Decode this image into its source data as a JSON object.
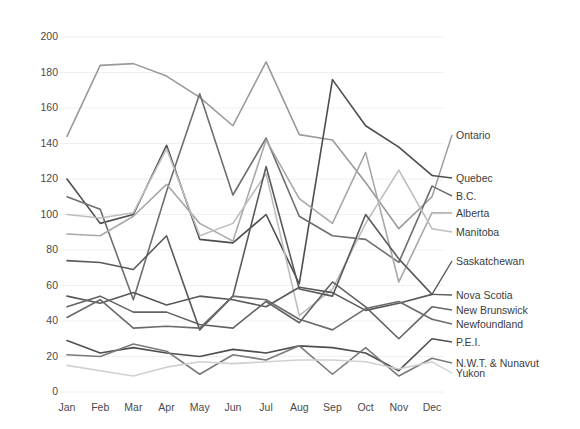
{
  "chart_data": {
    "type": "line",
    "title": "",
    "xlabel": "",
    "ylabel": "",
    "ylim": [
      0,
      200
    ],
    "ytick_step": 20,
    "grid": true,
    "legend_position": "right-inline-at-last-point",
    "categories": [
      "Jan",
      "Feb",
      "Mar",
      "Apr",
      "May",
      "Jun",
      "Jul",
      "Aug",
      "Sep",
      "Oct",
      "Nov",
      "Dec"
    ],
    "yticks": [
      0,
      20,
      40,
      60,
      80,
      100,
      120,
      140,
      160,
      180,
      200
    ],
    "series": [
      {
        "name": "Ontario",
        "color": "#9a9a9a",
        "values": [
          144,
          184,
          185,
          178,
          166,
          150,
          186,
          145,
          142,
          118,
          92,
          110
        ]
      },
      {
        "name": "Quebec",
        "color": "#4d4d4d",
        "values": [
          120,
          95,
          100,
          139,
          86,
          84,
          100,
          61,
          176,
          150,
          138,
          122
        ]
      },
      {
        "name": "B.C.",
        "color": "#6e6e6e",
        "values": [
          110,
          103,
          52,
          113,
          168,
          111,
          143,
          99,
          88,
          86,
          73,
          116
        ]
      },
      {
        "name": "Alberta",
        "color": "#a8a8a8",
        "values": [
          89,
          88,
          99,
          117,
          95,
          85,
          142,
          109,
          95,
          135,
          62,
          101
        ]
      },
      {
        "name": "Manitoba",
        "color": "#bdbdbd",
        "values": [
          100,
          98,
          101,
          137,
          88,
          95,
          123,
          43,
          58,
          95,
          125,
          92
        ]
      },
      {
        "name": "Saskatchewan",
        "color": "#5a5a5a",
        "values": [
          74,
          73,
          69,
          88,
          35,
          54,
          127,
          58,
          54,
          100,
          75,
          55
        ]
      },
      {
        "name": "Nova Scotia",
        "color": "#585858",
        "values": [
          54,
          50,
          56,
          49,
          54,
          52,
          48,
          59,
          56,
          46,
          50,
          55
        ]
      },
      {
        "name": "New Brunswick",
        "color": "#636363",
        "values": [
          48,
          54,
          45,
          45,
          38,
          36,
          51,
          39,
          62,
          48,
          30,
          48
        ]
      },
      {
        "name": "Newfoundland",
        "color": "#6b6b6b",
        "values": [
          42,
          52,
          36,
          37,
          36,
          54,
          52,
          41,
          35,
          47,
          51,
          41
        ]
      },
      {
        "name": "P.E.I.",
        "color": "#4f4f4f",
        "values": [
          29,
          22,
          25,
          22,
          20,
          24,
          22,
          26,
          25,
          22,
          12,
          30
        ]
      },
      {
        "name": "N.W.T. & Nunavut",
        "color": "#7a7a7a",
        "values": [
          21,
          20,
          27,
          23,
          10,
          21,
          18,
          26,
          10,
          25,
          9,
          19
        ]
      },
      {
        "name": "Yukon",
        "color": "#d0d0d0",
        "values": [
          15,
          12,
          9,
          14,
          17,
          16,
          17,
          18,
          18,
          17,
          13,
          17
        ]
      }
    ]
  },
  "axis": {
    "y_labels": [
      "200",
      "180",
      "160",
      "140",
      "120",
      "100",
      "80",
      "60",
      "40",
      "20",
      "0"
    ],
    "x_labels": [
      "Jan",
      "Feb",
      "Mar",
      "Apr",
      "May",
      "Jun",
      "Jul",
      "Aug",
      "Sep",
      "Oct",
      "Nov",
      "Dec"
    ]
  },
  "legend": {
    "labels": [
      "Ontario",
      "Quebec",
      "B.C.",
      "Alberta",
      "Manitoba",
      "Saskatchewan",
      "Nova Scotia",
      "New Brunswick",
      "Newfoundland",
      "P.E.I.",
      "N.W.T. & Nunavut",
      "Yukon"
    ],
    "label_y": [
      138,
      181,
      199,
      216,
      235,
      264,
      298,
      313,
      327,
      345,
      366,
      376
    ]
  },
  "colors": {
    "background": "#ffffff",
    "grid": "#f0f0f0",
    "tick_text": "#4a4a4a",
    "legend_text": "#3c3c3c"
  }
}
